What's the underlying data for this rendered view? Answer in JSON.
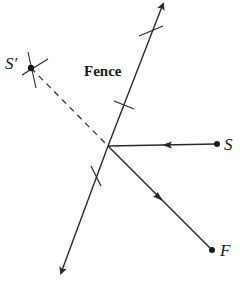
{
  "diagram": {
    "labels": {
      "fence": "Fence",
      "s_prime": "S′",
      "s": "S",
      "f": "F"
    },
    "colors": {
      "line": "#2a2a2a",
      "background": "#ffffff"
    },
    "points": {
      "s_prime": [
        31,
        68
      ],
      "s": [
        217,
        144
      ],
      "f": [
        212,
        250
      ],
      "reflection_point": [
        108,
        146
      ],
      "fence_top": [
        163,
        2
      ],
      "fence_bottom": [
        60,
        275
      ]
    }
  }
}
